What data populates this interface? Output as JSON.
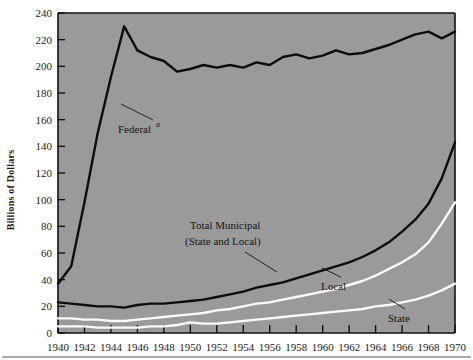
{
  "axis": {
    "ylabel": "Billions of Dollars",
    "yticks": [
      "0",
      "20",
      "40",
      "60",
      "80",
      "100",
      "120",
      "140",
      "160",
      "180",
      "200",
      "220",
      "240"
    ],
    "xticks": [
      "1940",
      "1942",
      "1944",
      "1946",
      "1948",
      "1950",
      "1952",
      "1954",
      "1956",
      "1958",
      "1960",
      "1962",
      "1964",
      "1966",
      "1968",
      "1970"
    ]
  },
  "annotations": {
    "federal": "Federal",
    "federal_sup": "a",
    "total_municipal_line1": "Total Municipal",
    "total_municipal_line2": "(State and Local)",
    "local": "Local",
    "state": "State"
  },
  "colors": {
    "plot_background": "#9a9a9a",
    "dark_series": "#0d0d0d",
    "light_series": "#fafafa",
    "axis": "#111111",
    "page_background": "#ffffff"
  },
  "chart_data": {
    "type": "line",
    "title": "",
    "xlabel": "",
    "ylabel": "Billions of Dollars",
    "xlim": [
      1940,
      1970
    ],
    "ylim": [
      0,
      240
    ],
    "grid": false,
    "legend": "inline-annotations",
    "x": [
      1940,
      1941,
      1942,
      1943,
      1944,
      1945,
      1946,
      1947,
      1948,
      1949,
      1950,
      1951,
      1952,
      1953,
      1954,
      1955,
      1956,
      1957,
      1958,
      1959,
      1960,
      1961,
      1962,
      1963,
      1964,
      1965,
      1966,
      1967,
      1968,
      1969,
      1970
    ],
    "series": [
      {
        "name": "Federal",
        "color": "#0d0d0d",
        "values": [
          37,
          50,
          98,
          150,
          192,
          230,
          212,
          207,
          204,
          196,
          198,
          201,
          199,
          201,
          199,
          203,
          201,
          207,
          209,
          206,
          208,
          212,
          209,
          210,
          213,
          216,
          220,
          224,
          226,
          221,
          226
        ]
      },
      {
        "name": "Total Municipal (State and Local)",
        "color": "#0d0d0d",
        "values": [
          23,
          22,
          21,
          20,
          20,
          19,
          21,
          22,
          22,
          23,
          24,
          25,
          27,
          29,
          31,
          34,
          36,
          38,
          41,
          44,
          47,
          50,
          53,
          57,
          62,
          68,
          76,
          85,
          97,
          116,
          143
        ]
      },
      {
        "name": "Local",
        "color": "#fafafa",
        "values": [
          11,
          11,
          10,
          10,
          9,
          9,
          10,
          11,
          12,
          13,
          14,
          15,
          17,
          18,
          20,
          22,
          23,
          25,
          27,
          29,
          31,
          33,
          36,
          39,
          43,
          48,
          53,
          59,
          68,
          82,
          98
        ]
      },
      {
        "name": "State",
        "color": "#fafafa",
        "values": [
          5,
          5,
          5,
          4,
          4,
          4,
          4,
          5,
          5,
          6,
          8,
          7,
          7,
          8,
          9,
          10,
          11,
          12,
          13,
          14,
          15,
          16,
          17,
          18,
          20,
          21,
          23,
          25,
          28,
          32,
          37
        ]
      }
    ]
  }
}
